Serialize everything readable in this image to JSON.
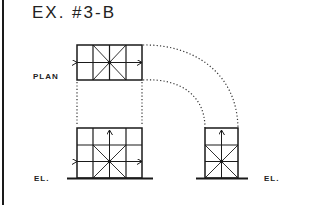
{
  "title": "EX. #3-B",
  "labels": {
    "plan": "PLAN",
    "elevation_left": "EL.",
    "elevation_right": "EL."
  },
  "colors": {
    "ink": "#1a1a1a"
  }
}
